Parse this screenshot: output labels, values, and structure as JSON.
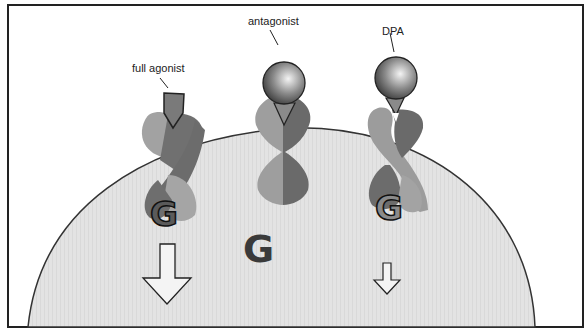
{
  "diagram": {
    "type": "receptor-ligand schematic",
    "labels": {
      "full_agonist": "full agonist",
      "antagonist": "antagonist",
      "dpa": "DPA"
    },
    "g_protein_letter": "G",
    "colors": {
      "frame": "#222222",
      "cell_fill": "#e2e2e2",
      "cell_outline": "#333333",
      "receptor_light": "#9a9a9a",
      "receptor_dark": "#6a6a6a",
      "ligand_sphere_light": "#f2f2f2",
      "ligand_sphere_dark": "#4a4a4a",
      "free_g": "#3a3a3a",
      "arrow_fill": "#f4f4f4"
    },
    "signals": {
      "full_agonist_arrow": "large",
      "dpa_arrow": "small",
      "antagonist_arrow": "none"
    }
  }
}
